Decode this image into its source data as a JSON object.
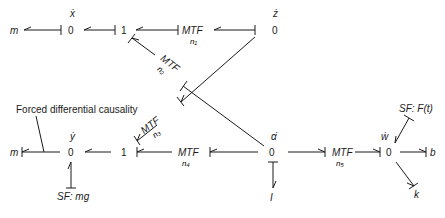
{
  "diagram": {
    "type": "bond-graph",
    "annotation": "Forced differential causality",
    "top_row": {
      "left_element": "m",
      "junction_x": {
        "type": "0",
        "label": "ẋ"
      },
      "junction_1": "1",
      "mtf_1": {
        "label": "MTF",
        "modulus": "n₁"
      },
      "junction_z": {
        "type": "0",
        "label": "ż"
      }
    },
    "diagonal": {
      "mtf_2": {
        "label": "MTF",
        "modulus": "n₂"
      },
      "mtf_3": {
        "label": "MTF",
        "modulus": "n₃"
      }
    },
    "bottom_row": {
      "left_element": "m",
      "junction_y": {
        "type": "0",
        "label": "ẏ"
      },
      "source_y": "SF: mg",
      "junction_1": "1",
      "mtf_4": {
        "label": "MTF",
        "modulus": "n₄"
      },
      "junction_alpha": {
        "type": "0",
        "label": "α̇"
      },
      "inertia": "I",
      "mtf_5": {
        "label": "MTF",
        "modulus": "n₅"
      },
      "junction_w": {
        "type": "0",
        "label": "ẇ"
      },
      "source_w": "SF: F(t)",
      "damper": "b",
      "spring": "k"
    }
  }
}
